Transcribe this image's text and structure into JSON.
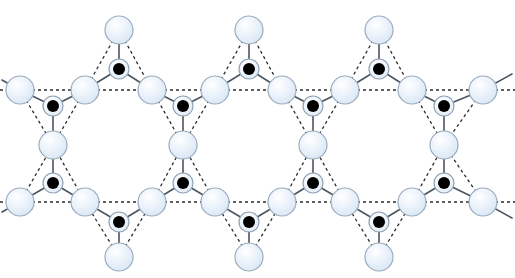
{
  "figure": {
    "type": "crystal-lattice-schematic",
    "width": 515,
    "height": 278,
    "background": "#ffffff"
  },
  "style": {
    "large_atom_fill": "#e9f1fa",
    "large_atom_fill_2": "#dfeaf6",
    "large_atom_stroke": "#9bacbd",
    "small_atom_ring_fill": "#eef4fb",
    "small_atom_ring_stroke": "#8fa2b4",
    "small_atom_core": "#000000",
    "bond_stroke": "#4a5560",
    "guide_stroke": "#2b2b2b",
    "large_atom_r": 14,
    "small_atom_ring_r": 10,
    "small_atom_core_r": 6,
    "bond_width": 1.6,
    "guide_width": 1.3,
    "guide_dash": "3,3"
  },
  "legend": {
    "large_atom_label": "ligand site (open circle)",
    "small_atom_label": "metal site (filled circle)",
    "bond_label": "bond (solid line)",
    "guide_label": "triangle / lattice guide (dashed line)"
  },
  "lattice": {
    "period_x": 130,
    "row_top_y": 90,
    "row_bottom_y": 202,
    "apex_top_y": 30,
    "apex_bottom_y": 257,
    "mid_upper_y": 106,
    "mid_center_y": 145,
    "mid_lower_y": 183,
    "cells": 3,
    "description": "Three repeating star units tiled horizontally; hexagonal voids between units."
  },
  "large_atoms": [
    {
      "id": "L01",
      "x": 20,
      "y": 90
    },
    {
      "id": "L02",
      "x": 85,
      "y": 90
    },
    {
      "id": "L03",
      "x": 152,
      "y": 90
    },
    {
      "id": "L04",
      "x": 215,
      "y": 90
    },
    {
      "id": "L05",
      "x": 282,
      "y": 90
    },
    {
      "id": "L06",
      "x": 345,
      "y": 90
    },
    {
      "id": "L07",
      "x": 412,
      "y": 90
    },
    {
      "id": "L08",
      "x": 483,
      "y": 90
    },
    {
      "id": "L09",
      "x": 20,
      "y": 202
    },
    {
      "id": "L10",
      "x": 85,
      "y": 202
    },
    {
      "id": "L11",
      "x": 152,
      "y": 202
    },
    {
      "id": "L12",
      "x": 215,
      "y": 202
    },
    {
      "id": "L13",
      "x": 282,
      "y": 202
    },
    {
      "id": "L14",
      "x": 345,
      "y": 202
    },
    {
      "id": "L15",
      "x": 412,
      "y": 202
    },
    {
      "id": "L16",
      "x": 483,
      "y": 202
    },
    {
      "id": "L17",
      "x": 119,
      "y": 30
    },
    {
      "id": "L18",
      "x": 249,
      "y": 30
    },
    {
      "id": "L19",
      "x": 379,
      "y": 30
    },
    {
      "id": "L20",
      "x": 119,
      "y": 257
    },
    {
      "id": "L21",
      "x": 249,
      "y": 257
    },
    {
      "id": "L22",
      "x": 379,
      "y": 257
    },
    {
      "id": "L23",
      "x": 53,
      "y": 145
    },
    {
      "id": "L24",
      "x": 183,
      "y": 145
    },
    {
      "id": "L25",
      "x": 313,
      "y": 145
    },
    {
      "id": "L26",
      "x": 444,
      "y": 145
    }
  ],
  "small_atoms": [
    {
      "id": "M01",
      "x": 119,
      "y": 69
    },
    {
      "id": "M02",
      "x": 249,
      "y": 69
    },
    {
      "id": "M03",
      "x": 379,
      "y": 69
    },
    {
      "id": "M04",
      "x": 53,
      "y": 106
    },
    {
      "id": "M05",
      "x": 183,
      "y": 106
    },
    {
      "id": "M06",
      "x": 313,
      "y": 106
    },
    {
      "id": "M07",
      "x": 444,
      "y": 106
    },
    {
      "id": "M08",
      "x": 53,
      "y": 183
    },
    {
      "id": "M09",
      "x": 183,
      "y": 183
    },
    {
      "id": "M10",
      "x": 313,
      "y": 183
    },
    {
      "id": "M11",
      "x": 444,
      "y": 183
    },
    {
      "id": "M12",
      "x": 119,
      "y": 222
    },
    {
      "id": "M13",
      "x": 249,
      "y": 222
    },
    {
      "id": "M14",
      "x": 379,
      "y": 222
    }
  ],
  "bonds": [
    {
      "x1": 119,
      "y1": 30,
      "x2": 119,
      "y2": 69
    },
    {
      "x1": 249,
      "y1": 30,
      "x2": 249,
      "y2": 69
    },
    {
      "x1": 379,
      "y1": 30,
      "x2": 379,
      "y2": 69
    },
    {
      "x1": 119,
      "y1": 69,
      "x2": 85,
      "y2": 90
    },
    {
      "x1": 119,
      "y1": 69,
      "x2": 152,
      "y2": 90
    },
    {
      "x1": 249,
      "y1": 69,
      "x2": 215,
      "y2": 90
    },
    {
      "x1": 249,
      "y1": 69,
      "x2": 282,
      "y2": 90
    },
    {
      "x1": 379,
      "y1": 69,
      "x2": 345,
      "y2": 90
    },
    {
      "x1": 379,
      "y1": 69,
      "x2": 412,
      "y2": 90
    },
    {
      "x1": 53,
      "y1": 106,
      "x2": 20,
      "y2": 90
    },
    {
      "x1": 53,
      "y1": 106,
      "x2": 85,
      "y2": 90
    },
    {
      "x1": 183,
      "y1": 106,
      "x2": 152,
      "y2": 90
    },
    {
      "x1": 183,
      "y1": 106,
      "x2": 215,
      "y2": 90
    },
    {
      "x1": 313,
      "y1": 106,
      "x2": 282,
      "y2": 90
    },
    {
      "x1": 313,
      "y1": 106,
      "x2": 345,
      "y2": 90
    },
    {
      "x1": 444,
      "y1": 106,
      "x2": 412,
      "y2": 90
    },
    {
      "x1": 444,
      "y1": 106,
      "x2": 483,
      "y2": 90
    },
    {
      "x1": 53,
      "y1": 106,
      "x2": 53,
      "y2": 145
    },
    {
      "x1": 183,
      "y1": 106,
      "x2": 183,
      "y2": 145
    },
    {
      "x1": 313,
      "y1": 106,
      "x2": 313,
      "y2": 145
    },
    {
      "x1": 444,
      "y1": 106,
      "x2": 444,
      "y2": 145
    },
    {
      "x1": 53,
      "y1": 145,
      "x2": 53,
      "y2": 183
    },
    {
      "x1": 183,
      "y1": 145,
      "x2": 183,
      "y2": 183
    },
    {
      "x1": 313,
      "y1": 145,
      "x2": 313,
      "y2": 183
    },
    {
      "x1": 444,
      "y1": 145,
      "x2": 444,
      "y2": 183
    },
    {
      "x1": 53,
      "y1": 183,
      "x2": 20,
      "y2": 202
    },
    {
      "x1": 53,
      "y1": 183,
      "x2": 85,
      "y2": 202
    },
    {
      "x1": 183,
      "y1": 183,
      "x2": 152,
      "y2": 202
    },
    {
      "x1": 183,
      "y1": 183,
      "x2": 215,
      "y2": 202
    },
    {
      "x1": 313,
      "y1": 183,
      "x2": 282,
      "y2": 202
    },
    {
      "x1": 313,
      "y1": 183,
      "x2": 345,
      "y2": 202
    },
    {
      "x1": 444,
      "y1": 183,
      "x2": 412,
      "y2": 202
    },
    {
      "x1": 444,
      "y1": 183,
      "x2": 483,
      "y2": 202
    },
    {
      "x1": 119,
      "y1": 222,
      "x2": 85,
      "y2": 202
    },
    {
      "x1": 119,
      "y1": 222,
      "x2": 152,
      "y2": 202
    },
    {
      "x1": 249,
      "y1": 222,
      "x2": 215,
      "y2": 202
    },
    {
      "x1": 249,
      "y1": 222,
      "x2": 282,
      "y2": 202
    },
    {
      "x1": 379,
      "y1": 222,
      "x2": 345,
      "y2": 202
    },
    {
      "x1": 379,
      "y1": 222,
      "x2": 412,
      "y2": 202
    },
    {
      "x1": 119,
      "y1": 222,
      "x2": 119,
      "y2": 257
    },
    {
      "x1": 249,
      "y1": 222,
      "x2": 249,
      "y2": 257
    },
    {
      "x1": 379,
      "y1": 222,
      "x2": 379,
      "y2": 257
    },
    {
      "x1": 20,
      "y1": 90,
      "x2": 2,
      "y2": 80
    },
    {
      "x1": 483,
      "y1": 90,
      "x2": 512,
      "y2": 74
    },
    {
      "x1": 20,
      "y1": 202,
      "x2": 2,
      "y2": 212
    },
    {
      "x1": 483,
      "y1": 202,
      "x2": 512,
      "y2": 218
    }
  ],
  "guides": [
    {
      "x1": 20,
      "y1": 90,
      "x2": 85,
      "y2": 90
    },
    {
      "x1": 85,
      "y1": 90,
      "x2": 152,
      "y2": 90
    },
    {
      "x1": 152,
      "y1": 90,
      "x2": 215,
      "y2": 90
    },
    {
      "x1": 215,
      "y1": 90,
      "x2": 282,
      "y2": 90
    },
    {
      "x1": 282,
      "y1": 90,
      "x2": 345,
      "y2": 90
    },
    {
      "x1": 345,
      "y1": 90,
      "x2": 412,
      "y2": 90
    },
    {
      "x1": 412,
      "y1": 90,
      "x2": 483,
      "y2": 90
    },
    {
      "x1": 0,
      "y1": 90,
      "x2": 20,
      "y2": 90
    },
    {
      "x1": 483,
      "y1": 90,
      "x2": 515,
      "y2": 90
    },
    {
      "x1": 20,
      "y1": 202,
      "x2": 85,
      "y2": 202
    },
    {
      "x1": 85,
      "y1": 202,
      "x2": 152,
      "y2": 202
    },
    {
      "x1": 152,
      "y1": 202,
      "x2": 215,
      "y2": 202
    },
    {
      "x1": 215,
      "y1": 202,
      "x2": 282,
      "y2": 202
    },
    {
      "x1": 282,
      "y1": 202,
      "x2": 345,
      "y2": 202
    },
    {
      "x1": 345,
      "y1": 202,
      "x2": 412,
      "y2": 202
    },
    {
      "x1": 412,
      "y1": 202,
      "x2": 483,
      "y2": 202
    },
    {
      "x1": 0,
      "y1": 202,
      "x2": 20,
      "y2": 202
    },
    {
      "x1": 483,
      "y1": 202,
      "x2": 515,
      "y2": 202
    },
    {
      "x1": 119,
      "y1": 30,
      "x2": 85,
      "y2": 90
    },
    {
      "x1": 119,
      "y1": 30,
      "x2": 152,
      "y2": 90
    },
    {
      "x1": 249,
      "y1": 30,
      "x2": 215,
      "y2": 90
    },
    {
      "x1": 249,
      "y1": 30,
      "x2": 282,
      "y2": 90
    },
    {
      "x1": 379,
      "y1": 30,
      "x2": 345,
      "y2": 90
    },
    {
      "x1": 379,
      "y1": 30,
      "x2": 412,
      "y2": 90
    },
    {
      "x1": 119,
      "y1": 257,
      "x2": 85,
      "y2": 202
    },
    {
      "x1": 119,
      "y1": 257,
      "x2": 152,
      "y2": 202
    },
    {
      "x1": 249,
      "y1": 257,
      "x2": 215,
      "y2": 202
    },
    {
      "x1": 249,
      "y1": 257,
      "x2": 282,
      "y2": 202
    },
    {
      "x1": 379,
      "y1": 257,
      "x2": 345,
      "y2": 202
    },
    {
      "x1": 379,
      "y1": 257,
      "x2": 412,
      "y2": 202
    },
    {
      "x1": 20,
      "y1": 90,
      "x2": 53,
      "y2": 145
    },
    {
      "x1": 85,
      "y1": 90,
      "x2": 53,
      "y2": 145
    },
    {
      "x1": 152,
      "y1": 90,
      "x2": 183,
      "y2": 145
    },
    {
      "x1": 215,
      "y1": 90,
      "x2": 183,
      "y2": 145
    },
    {
      "x1": 282,
      "y1": 90,
      "x2": 313,
      "y2": 145
    },
    {
      "x1": 345,
      "y1": 90,
      "x2": 313,
      "y2": 145
    },
    {
      "x1": 412,
      "y1": 90,
      "x2": 444,
      "y2": 145
    },
    {
      "x1": 483,
      "y1": 90,
      "x2": 444,
      "y2": 145
    },
    {
      "x1": 20,
      "y1": 202,
      "x2": 53,
      "y2": 145
    },
    {
      "x1": 85,
      "y1": 202,
      "x2": 53,
      "y2": 145
    },
    {
      "x1": 152,
      "y1": 202,
      "x2": 183,
      "y2": 145
    },
    {
      "x1": 215,
      "y1": 202,
      "x2": 183,
      "y2": 145
    },
    {
      "x1": 282,
      "y1": 202,
      "x2": 313,
      "y2": 145
    },
    {
      "x1": 345,
      "y1": 202,
      "x2": 313,
      "y2": 145
    },
    {
      "x1": 412,
      "y1": 202,
      "x2": 444,
      "y2": 145
    },
    {
      "x1": 483,
      "y1": 202,
      "x2": 444,
      "y2": 145
    }
  ]
}
